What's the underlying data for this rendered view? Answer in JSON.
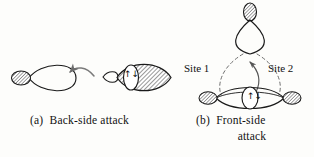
{
  "figure": {
    "width": 314,
    "height": 157,
    "background_color": "#fdfdfb",
    "ink_color": "#111111",
    "hatch_color": "#4a4a4a"
  },
  "panel_a": {
    "label": "(a)  Back-side attack",
    "nucleophile_orbital": {
      "name": "nucleophile-p-orbital",
      "description": "teardrop lobe pointing right with small hatched back lobe"
    },
    "arrow": {
      "name": "attack-arrow",
      "description": "curved arrow pointing left toward nucleophile"
    },
    "substrate_orbital": {
      "name": "substrate-sigma-orbital",
      "description": "large hatched lens-shaped lobe with small back lobe"
    },
    "electron_pair_symbol": "↑↓"
  },
  "panel_b": {
    "label_line1": "(b)  Front-side",
    "label_line2": "attack",
    "site_1_label": "Site 1",
    "site_2_label": "Site 2",
    "top_orbital": {
      "name": "incoming-nucleophile-orbital",
      "description": "large teardrop lobe pointing down with hatched top lobe"
    },
    "bottom_orbital": {
      "name": "substrate-orbital",
      "description": "horizontal lens orbital with hatched end lobes"
    },
    "electron_pair_symbol": "↑↓",
    "dashed_paths": [
      "site-1-dashed-path",
      "site-2-dashed-path"
    ],
    "curved_arrow": {
      "name": "electron-flow-arrow",
      "description": "curved arrow from substrate up to nucleophile"
    }
  }
}
